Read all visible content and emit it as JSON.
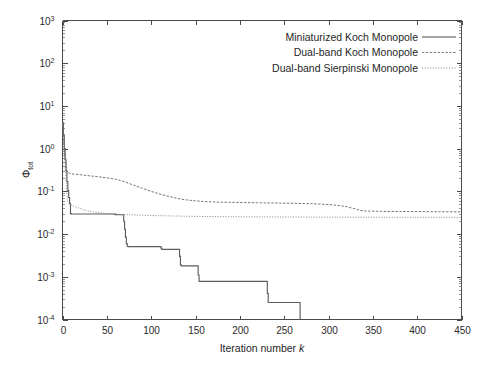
{
  "chart_data": {
    "type": "line",
    "title": "",
    "xlabel": "Iteration number k",
    "ylabel": "Φtot",
    "ylabel_base": "Φ",
    "ylabel_sub": "tot",
    "xlim": [
      0,
      450
    ],
    "ylim": [
      0.0001,
      1000
    ],
    "yscale": "log",
    "xscale": "linear",
    "grid": false,
    "legend_position": "top-right",
    "xticks": [
      0,
      50,
      100,
      150,
      200,
      250,
      300,
      350,
      400,
      450
    ],
    "xtick_labels": [
      "0",
      "50",
      "100",
      "150",
      "200",
      "250",
      "300",
      "350",
      "400",
      "450"
    ],
    "yticks": [
      0.0001,
      0.001,
      0.01,
      0.1,
      1,
      10,
      100,
      1000
    ],
    "ytick_labels": [
      "10-4",
      "10-3",
      "10-2",
      "10-1",
      "100",
      "101",
      "102",
      "103"
    ],
    "ytick_exponents": [
      "-4",
      "-3",
      "-2",
      "-1",
      "0",
      "1",
      "2",
      "3"
    ],
    "ytick_mantissa": "10",
    "series": [
      {
        "name": "Miniaturized Koch Monopole",
        "style": "solid",
        "color": "#5d5d5d",
        "x": [
          0,
          1,
          2,
          3,
          4,
          5,
          6,
          7,
          8,
          9,
          10,
          58,
          59,
          60,
          61,
          68,
          69,
          70,
          71,
          72,
          73,
          74,
          110,
          111,
          112,
          131,
          132,
          133,
          134,
          152,
          153,
          154,
          230,
          231,
          232,
          268
        ],
        "y": [
          4.0,
          2.1,
          1.0,
          0.55,
          0.3,
          0.17,
          0.105,
          0.072,
          0.052,
          0.03,
          0.0295,
          0.0295,
          0.029,
          0.0285,
          0.0283,
          0.0283,
          0.02,
          0.013,
          0.0085,
          0.006,
          0.0052,
          0.0051,
          0.0051,
          0.0047,
          0.0044,
          0.0044,
          0.003,
          0.0019,
          0.0018,
          0.0018,
          0.0011,
          0.00078,
          0.00078,
          0.00041,
          0.00025,
          0.00025
        ]
      },
      {
        "name": "Dual-band Koch Monopole",
        "style": "dashed",
        "color": "#6e6e6e",
        "x": [
          0,
          1,
          2,
          3,
          4,
          5,
          6,
          7,
          8,
          9,
          10,
          20,
          30,
          40,
          50,
          60,
          70,
          80,
          90,
          100,
          110,
          120,
          130,
          140,
          150,
          160,
          170,
          180,
          200,
          220,
          240,
          260,
          280,
          300,
          310,
          320,
          330,
          335,
          340,
          360,
          380,
          400,
          420,
          440,
          450
        ],
        "y": [
          4.0,
          2.1,
          1.05,
          0.6,
          0.37,
          0.3,
          0.275,
          0.268,
          0.265,
          0.262,
          0.258,
          0.245,
          0.232,
          0.22,
          0.207,
          0.192,
          0.168,
          0.14,
          0.118,
          0.1,
          0.086,
          0.076,
          0.068,
          0.063,
          0.06,
          0.0575,
          0.0565,
          0.0558,
          0.0548,
          0.054,
          0.0533,
          0.0525,
          0.0515,
          0.0492,
          0.047,
          0.044,
          0.039,
          0.036,
          0.0348,
          0.034,
          0.0338,
          0.0336,
          0.0334,
          0.0332,
          0.0332
        ]
      },
      {
        "name": "Dual-band Sierpinski Monopole",
        "style": "dotted",
        "color": "#7d7d7d",
        "x": [
          0,
          1,
          2,
          3,
          4,
          5,
          6,
          7,
          8,
          10,
          15,
          20,
          25,
          30,
          35,
          40,
          50,
          60,
          70,
          80,
          100,
          120,
          140,
          160,
          180,
          200,
          250,
          300,
          350,
          400,
          450
        ],
        "y": [
          4.0,
          2.0,
          0.95,
          0.42,
          0.175,
          0.082,
          0.058,
          0.0525,
          0.0508,
          0.048,
          0.043,
          0.0395,
          0.0365,
          0.0345,
          0.033,
          0.0318,
          0.0302,
          0.0293,
          0.0286,
          0.0281,
          0.0272,
          0.0266,
          0.0261,
          0.0258,
          0.0256,
          0.0254,
          0.0251,
          0.0249,
          0.0248,
          0.0247,
          0.0246
        ]
      }
    ]
  },
  "legend": {
    "entries": [
      {
        "label": "Miniaturized Koch Monopole",
        "style": "solid"
      },
      {
        "label": "Dual-band Koch Monopole",
        "style": "dashed"
      },
      {
        "label": "Dual-band Sierpinski Monopole",
        "style": "dotted"
      }
    ]
  },
  "axes": {
    "x_title": "Iteration number",
    "x_title_var": "k",
    "y_title_base": "Φ",
    "y_title_sub": "tot"
  }
}
